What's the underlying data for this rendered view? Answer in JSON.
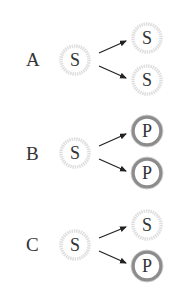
{
  "colors": {
    "s_ring": "#dcdcdc",
    "s_ring_inner": "#ebebeb",
    "p_ring": "#8c8c8c",
    "p_ring_outer": "#b0b0b0",
    "text": "#333333",
    "arrow": "#222222"
  },
  "rows": [
    {
      "label": "A",
      "source": "S",
      "targets": [
        "S",
        "S"
      ]
    },
    {
      "label": "B",
      "source": "S",
      "targets": [
        "P",
        "P"
      ]
    },
    {
      "label": "C",
      "source": "S",
      "targets": [
        "S",
        "P"
      ]
    }
  ]
}
